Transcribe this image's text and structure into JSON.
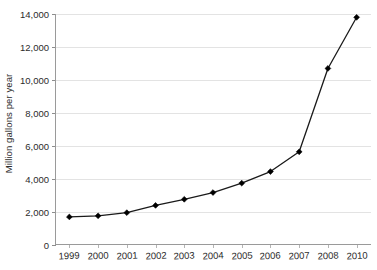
{
  "chart_data": {
    "type": "line",
    "title": "",
    "xlabel": "",
    "ylabel": "Million gallons per year",
    "categories": [
      "1999",
      "2000",
      "2001",
      "2002",
      "2003",
      "2004",
      "2005",
      "2006",
      "2007",
      "2008",
      "2010"
    ],
    "values": [
      1700,
      1770,
      1960,
      2400,
      2770,
      3180,
      3750,
      4450,
      5650,
      10700,
      13800
    ],
    "series": [
      {
        "name": "Million gallons per year",
        "values": [
          1700,
          1770,
          1960,
          2400,
          2770,
          3180,
          3750,
          4450,
          5650,
          10700,
          13800
        ]
      }
    ],
    "ylim": [
      0,
      14000
    ],
    "y_ticks": [
      0,
      2000,
      4000,
      6000,
      8000,
      10000,
      12000,
      14000
    ],
    "y_tick_labels": [
      "0",
      "2,000",
      "4,000",
      "6,000",
      "8,000",
      "10,000",
      "12,000",
      "14,000"
    ],
    "grid": true,
    "grid_axis": "y",
    "legend": "none",
    "marker": "diamond",
    "line_color": "#1a1a1a",
    "marker_color": "#000000",
    "grid_color": "#e3e3e3",
    "axis_color": "#9a9a9a",
    "text_color": "#2b2b2b",
    "background": "#ffffff"
  }
}
